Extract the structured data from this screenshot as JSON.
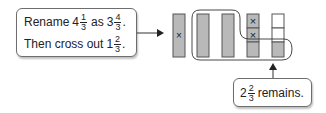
{
  "step_callout": {
    "line1": {
      "prefix": "Rename",
      "whole_a": "4",
      "num_a": "1",
      "den_a": "3",
      "mid": "as",
      "whole_b": "3",
      "num_b": "4",
      "den_b": "3",
      "end": "."
    },
    "line2": {
      "prefix": "Then cross out",
      "whole": "1",
      "num": "2",
      "den": "3",
      "end": "."
    }
  },
  "result_callout": {
    "whole": "2",
    "num": "2",
    "den": "3",
    "suffix": "remains."
  },
  "model": {
    "bars": [
      {
        "type": "whole",
        "crossed": true
      },
      {
        "type": "whole",
        "crossed": false
      },
      {
        "type": "whole",
        "crossed": false
      },
      {
        "type": "thirds",
        "segments": [
          {
            "shaded": true,
            "crossed": true
          },
          {
            "shaded": true,
            "crossed": true
          },
          {
            "shaded": true,
            "crossed": false
          }
        ]
      },
      {
        "type": "thirds",
        "segments": [
          {
            "shaded": false,
            "crossed": false
          },
          {
            "shaded": false,
            "crossed": false
          },
          {
            "shaded": true,
            "crossed": false
          }
        ]
      }
    ],
    "colors": {
      "shaded": "#b9b9b9",
      "outline": "#555555",
      "empty": "#ffffff"
    }
  }
}
